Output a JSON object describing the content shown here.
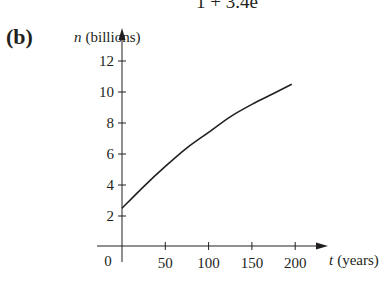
{
  "top_formula_partial": "1 + 3.4e",
  "panel_label": "(b)",
  "chart_data": {
    "type": "line",
    "title": "",
    "xlabel": "t (years)",
    "ylabel": "n (billions)",
    "x_var": "t",
    "x_unit": "(years)",
    "y_var": "n",
    "y_unit": "(billions)",
    "x_ticks": [
      0,
      50,
      100,
      150,
      200
    ],
    "y_ticks": [
      2,
      4,
      6,
      8,
      10,
      12
    ],
    "xlim": [
      0,
      240
    ],
    "ylim": [
      0,
      14
    ],
    "grid": false,
    "legend": "none",
    "series": [
      {
        "name": "n(t)",
        "x": [
          0,
          25,
          50,
          75,
          100,
          125,
          150,
          175,
          196
        ],
        "values": [
          2.5,
          3.9,
          5.2,
          6.4,
          7.4,
          8.4,
          9.2,
          9.9,
          10.5
        ]
      }
    ]
  }
}
